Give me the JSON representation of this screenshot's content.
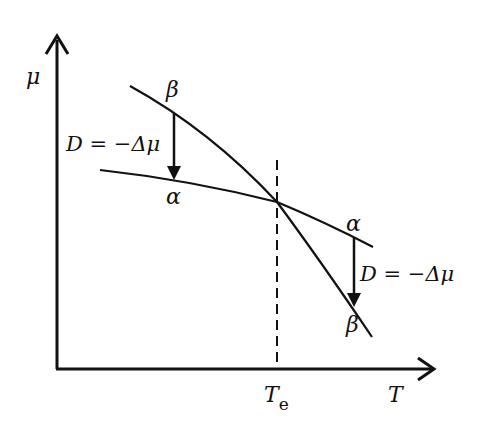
{
  "diagram": {
    "y_axis_label": "μ",
    "x_axis_label": "T",
    "equilibrium_label": "T",
    "equilibrium_subscript": "e",
    "curve_beta_top_label": "β",
    "curve_alpha_left_label": "α",
    "curve_alpha_right_label": "α",
    "curve_beta_bottom_label": "β",
    "driving_force_left": "D = −Δμ",
    "driving_force_right": "D = −Δμ"
  }
}
